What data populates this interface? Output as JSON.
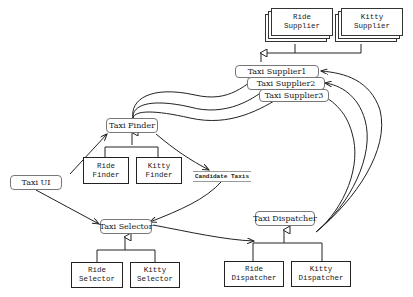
{
  "diagram": {
    "components": {
      "taxi_ui": "Taxi UI",
      "taxi_finder": "Taxi Finder",
      "taxi_selector": "Taxi Selector",
      "taxi_dispatcher": "Taxi Dispatcher",
      "taxi_supplier_1": "Taxi Supplier1",
      "taxi_supplier_2": "Taxi Supplier2",
      "taxi_supplier_3": "Taxi Supplier3",
      "candidate_taxis": "Candidate Taxis"
    },
    "implementations": {
      "ride_finder": "Ride\nFinder",
      "kitty_finder": "Kitty\nFinder",
      "ride_selector": "Ride\nSelector",
      "kitty_selector": "Kitty\nSelector",
      "ride_dispatcher": "Ride\nDispatcher",
      "kitty_dispatcher": "Kitty\nDispatcher",
      "ride_supplier": "Ride\nSupplier",
      "kitty_supplier": "Kitty\nSupplier"
    },
    "colors": {
      "line": "#222222",
      "box_border": "#777777",
      "background": "#ffffff"
    }
  }
}
